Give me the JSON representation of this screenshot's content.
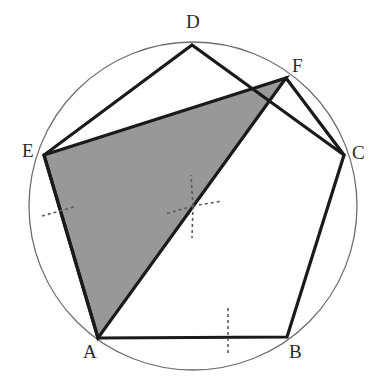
{
  "figure": {
    "background_color": "#ffffff",
    "canvas": {
      "width": 385,
      "height": 390
    }
  },
  "colors": {
    "stroke_dark": "#1a1a1a",
    "circle_stroke": "#6e6e6e",
    "shade_fill": "#989898",
    "dashed_stroke": "#5a5a5a",
    "label_text": "#2b2b2b"
  },
  "circle": {
    "name": "circumscribed-circle",
    "cx": 193,
    "cy": 206,
    "r": 164,
    "stroke_width": 1.3
  },
  "points": [
    {
      "id": "A",
      "label": "A",
      "x": 98,
      "y": 338,
      "label_x": 83,
      "label_y": 342
    },
    {
      "id": "B",
      "label": "B",
      "x": 287,
      "y": 337,
      "label_x": 289,
      "label_y": 342
    },
    {
      "id": "C",
      "label": "C",
      "x": 344,
      "y": 155,
      "label_x": 352,
      "label_y": 143
    },
    {
      "id": "D",
      "label": "D",
      "x": 192,
      "y": 45,
      "label_x": 186,
      "label_y": 12
    },
    {
      "id": "E",
      "label": "E",
      "x": 44,
      "y": 155,
      "label_x": 22,
      "label_y": 141
    },
    {
      "id": "F",
      "label": "F",
      "x": 286,
      "y": 78,
      "label_x": 292,
      "label_y": 56
    }
  ],
  "polygons": [
    {
      "name": "pentagon-ABCDE",
      "vertices": [
        "A",
        "B",
        "C",
        "D",
        "E"
      ],
      "points_attr": "98,338 287,337 344,155 192,45 44,155",
      "fill": "none",
      "stroke": "#1a1a1a",
      "stroke_width": 3.2
    },
    {
      "name": "shaded-triangle-EFA",
      "vertices": [
        "E",
        "F",
        "A"
      ],
      "points_attr": "44,155 286,78 98,338",
      "fill": "#989898",
      "stroke": "#1a1a1a",
      "stroke_width": 3.2
    }
  ],
  "extra_segments": [
    {
      "name": "segment-C-F",
      "from": "C",
      "to": "F",
      "x1": 344,
      "y1": 155,
      "x2": 286,
      "y2": 78,
      "stroke_width": 3.2
    }
  ],
  "center_mark": {
    "name": "circle-center-mark",
    "cx": 193,
    "cy": 206,
    "rays": [
      {
        "name": "center-ray-up",
        "x1": 193,
        "y1": 206,
        "x2": 191,
        "y2": 175
      },
      {
        "name": "center-ray-right",
        "x1": 193,
        "y1": 206,
        "x2": 222,
        "y2": 201
      },
      {
        "name": "center-ray-down",
        "x1": 193,
        "y1": 206,
        "x2": 192,
        "y2": 238
      },
      {
        "name": "center-ray-left",
        "x1": 193,
        "y1": 206,
        "x2": 165,
        "y2": 214
      }
    ]
  },
  "tick_marks": [
    {
      "name": "tick-mark-side-EA",
      "x1": 42,
      "y1": 216,
      "x2": 74,
      "y2": 207
    },
    {
      "name": "tick-mark-side-AB",
      "x1": 228,
      "y1": 308,
      "x2": 228,
      "y2": 353
    }
  ],
  "dash_style": {
    "dasharray": "3,3",
    "stroke_width": 1.6
  }
}
